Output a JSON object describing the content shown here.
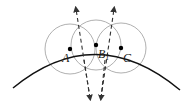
{
  "diagram": {
    "colors": {
      "arc": "#111111",
      "circles": "#b0b0b0",
      "dashed": "#333333",
      "points": "#000000",
      "background": "#ffffff"
    },
    "points": [
      {
        "id": "A",
        "label": "A",
        "x": 70,
        "y": 49,
        "label_x": 62,
        "label_y": 62
      },
      {
        "id": "B",
        "label": "B",
        "subscript": "1",
        "x": 96,
        "y": 45,
        "label_x": 98,
        "label_y": 58
      },
      {
        "id": "C",
        "label": "C",
        "x": 121,
        "y": 48,
        "label_x": 123,
        "label_y": 62
      }
    ],
    "circle_radius": 25,
    "dashed_lines": [
      {
        "x1": 90,
        "y1": 98,
        "x2": 76,
        "y2": 8
      },
      {
        "x1": 101,
        "y1": 98,
        "x2": 115,
        "y2": 8
      }
    ]
  }
}
